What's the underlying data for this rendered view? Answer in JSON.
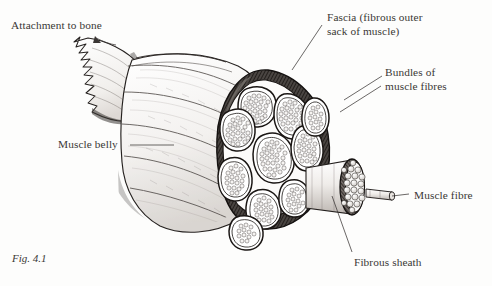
{
  "figure": {
    "caption": "Fig. 4.1",
    "background_color": "#fdfdfc",
    "ink_color": "#231f1d"
  },
  "labels": {
    "attachment_to_bone": "Attachment to bone",
    "fascia_line1": "Fascia (fibrous outer",
    "fascia_line2": "sack of muscle)",
    "bundles_line1": "Bundles of",
    "bundles_line2": "muscle fibres",
    "muscle_belly": "Muscle belly",
    "muscle_fibre": "Muscle fibre",
    "fibrous_sheath": "Fibrous sheath"
  },
  "anatomy": {
    "fascicle_count": 10,
    "extracted_bundle_fibre_count": 20,
    "pulled_fibre_count": 1,
    "parts": [
      "tendon / attachment to bone",
      "muscle belly",
      "fascia",
      "fascicle (bundle of muscle fibres)",
      "fibrous sheath",
      "muscle fibre"
    ]
  }
}
